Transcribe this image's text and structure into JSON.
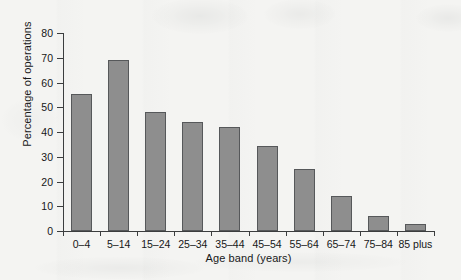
{
  "chart_data": {
    "type": "bar",
    "title": "",
    "xlabel": "Age band (years)",
    "ylabel": "Percentage of operations",
    "categories": [
      "0–4",
      "5–14",
      "15–24",
      "25–34",
      "35–44",
      "45–54",
      "55–64",
      "65–74",
      "75–84",
      "85 plus"
    ],
    "values": [
      55.5,
      69,
      48,
      44,
      42,
      34.5,
      25,
      14,
      6,
      3
    ],
    "ylim": [
      0,
      80
    ],
    "yticks": [
      0,
      10,
      20,
      30,
      40,
      50,
      60,
      70,
      80
    ],
    "ytick_labels": [
      "0",
      "10",
      "20",
      "30",
      "40",
      "50",
      "60",
      "70",
      "80"
    ],
    "grid": false,
    "legend": false,
    "bar_color": "#8e8e8e",
    "bar_edge_color": "#56585a",
    "axis_color": "#3b3d3e",
    "background_color": "#f4f4f2"
  }
}
